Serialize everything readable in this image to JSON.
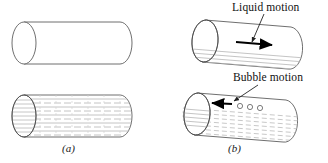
{
  "figure": {
    "background_color": "#ffffff",
    "width": 328,
    "height": 163
  },
  "panels": [
    {
      "id": "panel-a",
      "caption": "(a)",
      "orientation": "horizontal",
      "cylinders": [
        {
          "id": "a-top",
          "fill": "empty",
          "description": "empty horizontal pipe"
        },
        {
          "id": "a-bottom",
          "fill": "liquid-hatched",
          "description": "horizontal pipe filled with liquid, dashed hatching"
        }
      ]
    },
    {
      "id": "panel-b",
      "caption": "(b)",
      "orientation": "inclined",
      "cylinders": [
        {
          "id": "b-top",
          "fill": "partial-liquid-bottom",
          "description": "inclined pipe with liquid in lower region"
        },
        {
          "id": "b-bottom",
          "fill": "liquid-hatched-bubbles",
          "description": "inclined pipe filled with liquid and bubbles"
        }
      ]
    }
  ],
  "annotations": [
    {
      "id": "liquid-motion",
      "label": "Liquid motion",
      "arrow_direction": "right",
      "target": "b-top"
    },
    {
      "id": "bubble-motion",
      "label": "Bubble motion",
      "arrow_direction": "left",
      "target": "b-bottom"
    }
  ],
  "bubbles": {
    "count": 3,
    "target": "b-bottom"
  },
  "colors": {
    "outline": "#3a3a3a",
    "hatch": "#b8b8b8",
    "arrow": "#000000",
    "text": "#111111",
    "background": "#ffffff"
  }
}
